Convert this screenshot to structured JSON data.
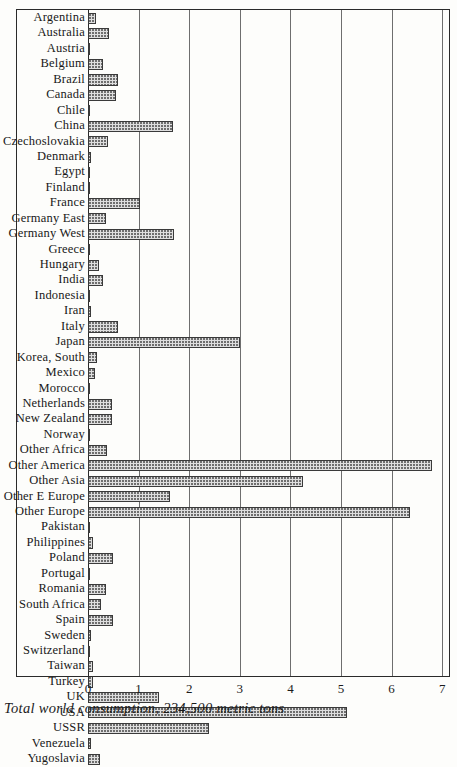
{
  "chart_data": {
    "type": "bar",
    "orientation": "horizontal",
    "title": "",
    "xlabel": "",
    "ylabel": "",
    "xlim": [
      0,
      7
    ],
    "xticks": [
      "0",
      "1",
      "2",
      "3",
      "4",
      "5",
      "6",
      "7"
    ],
    "grid": true,
    "legend": null,
    "caption": "Total world consumption, 234,500 metric tons",
    "categories": [
      "Argentina",
      "Australia",
      "Austria",
      "Belgium",
      "Brazil",
      "Canada",
      "Chile",
      "China",
      "Czechoslovakia",
      "Denmark",
      "Egypt",
      "Finland",
      "France",
      "Germany  East",
      "Germany  West",
      "Greece",
      "Hungary",
      "India",
      "Indonesia",
      "Iran",
      "Italy",
      "Japan",
      "Korea, South",
      "Mexico",
      "Morocco",
      "Netherlands",
      "New Zealand",
      "Norway",
      "Other Africa",
      "Other America",
      "Other Asia",
      "Other E Europe",
      "Other Europe",
      "Pakistan",
      "Philippines",
      "Poland",
      "Portugal",
      "Romania",
      "South Africa",
      "Spain",
      "Sweden",
      "Switzerland",
      "Taiwan",
      "Turkey",
      "UK",
      "USA",
      "USSR",
      "Venezuela",
      "Yugoslavia"
    ],
    "values": [
      0.16,
      0.42,
      0.04,
      0.3,
      0.6,
      0.56,
      0.04,
      1.68,
      0.4,
      0.06,
      0.02,
      0.03,
      1.02,
      0.36,
      1.7,
      0.03,
      0.22,
      0.3,
      0.02,
      0.06,
      0.6,
      3.0,
      0.18,
      0.13,
      0.02,
      0.48,
      0.48,
      0.04,
      0.38,
      6.8,
      4.24,
      1.62,
      6.36,
      0.04,
      0.1,
      0.5,
      0.03,
      0.36,
      0.26,
      0.5,
      0.05,
      0.04,
      0.1,
      0.1,
      1.4,
      5.12,
      2.4,
      0.06,
      0.24
    ]
  },
  "colors": {
    "bar_fill": "#dedede",
    "bar_stroke": "#3a3a3a",
    "gridline": "#6e6e6e",
    "axis": "#2a2a2a",
    "background": "#fdfdfb",
    "text": "#1b1b1b"
  }
}
